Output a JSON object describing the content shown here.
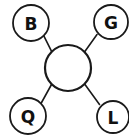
{
  "diagram": {
    "type": "star-graph",
    "background_color": "#ffffff",
    "stroke_color": "#1a1a1a",
    "fill_color": "#ffffff",
    "label_color": "#111111",
    "canvas": {
      "width": 129,
      "height": 138
    },
    "center_node": {
      "id": "center",
      "label": "",
      "cx": 68,
      "cy": 68,
      "r": 23,
      "stroke_width": 2.2
    },
    "leaf_nodes": [
      {
        "id": "node-b",
        "label": "B",
        "cx": 31,
        "cy": 23,
        "r": 18,
        "stroke_width": 1.8
      },
      {
        "id": "node-g",
        "label": "G",
        "cx": 111,
        "cy": 22,
        "r": 17,
        "stroke_width": 1.8
      },
      {
        "id": "node-q",
        "label": "Q",
        "cx": 28,
        "cy": 116,
        "r": 18,
        "stroke_width": 1.8
      },
      {
        "id": "node-l",
        "label": "L",
        "cx": 113,
        "cy": 117,
        "r": 16,
        "stroke_width": 1.8
      }
    ],
    "edges": [
      {
        "id": "edge-center-b",
        "from": "center",
        "to": "node-b",
        "x1": 51.7,
        "y1": 51.7,
        "x2": 43.7,
        "y2": 35.7,
        "stroke_width": 1.6
      },
      {
        "id": "edge-center-g",
        "from": "center",
        "to": "node-g",
        "x1": 84.5,
        "y1": 52.0,
        "x2": 97.0,
        "y2": 34.5,
        "stroke_width": 1.6
      },
      {
        "id": "edge-center-q",
        "from": "center",
        "to": "node-q",
        "x1": 51.5,
        "y1": 84.5,
        "x2": 41.0,
        "y2": 103.5,
        "stroke_width": 1.6
      },
      {
        "id": "edge-center-l",
        "from": "center",
        "to": "node-l",
        "x1": 84.8,
        "y1": 84.3,
        "x2": 99.5,
        "y2": 104.5,
        "stroke_width": 1.6
      }
    ]
  }
}
